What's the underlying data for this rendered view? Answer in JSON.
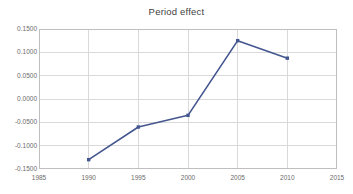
{
  "chart_data": {
    "type": "line",
    "title": "Period effect",
    "xlabel": "",
    "ylabel": "",
    "x": [
      1990,
      1995,
      2000,
      2005,
      2010
    ],
    "values": [
      -0.13,
      -0.06,
      -0.035,
      0.125,
      0.0875
    ],
    "series": [
      {
        "name": "Period effect",
        "values": [
          -0.13,
          -0.06,
          -0.035,
          0.125,
          0.0875
        ]
      }
    ],
    "xlim": [
      1985,
      2015
    ],
    "ylim": [
      -0.15,
      0.15
    ],
    "xticks": [
      1985,
      1990,
      1995,
      2000,
      2005,
      2010,
      2015
    ],
    "yticks": [
      0.15,
      0.1,
      0.05,
      0.0,
      -0.05,
      -0.1,
      -0.15
    ],
    "xtick_labels": [
      "1985",
      "1990",
      "1995",
      "2000",
      "2005",
      "2010",
      "2015"
    ],
    "ytick_labels": [
      "0.1500",
      "0.1000",
      "0.0500",
      "0.0000",
      "-0.0500",
      "-0.1000",
      "-0.1500"
    ],
    "grid": true,
    "legend": false,
    "legend_position": "none",
    "series_color": "#44568F",
    "grid_color": "#D9D9D9",
    "axis_color": "#BFBFBF",
    "marker": "square",
    "background": "#FFFFFF"
  }
}
